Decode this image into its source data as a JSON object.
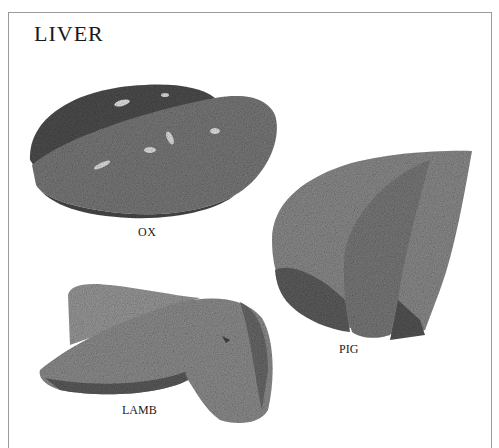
{
  "page": {
    "title": "LIVER",
    "figures": [
      {
        "id": "ox",
        "label": "OX"
      },
      {
        "id": "pig",
        "label": "PIG"
      },
      {
        "id": "lamb",
        "label": "LAMB"
      }
    ]
  },
  "colors": {
    "ox_dark": "#4e4e4e",
    "ox_light": "#777777",
    "pig_main": "#8a8a8a",
    "pig_dark": "#5a5a5a",
    "lamb_main": "#8e8e8e",
    "lamb_dark": "#5e5e5e",
    "border": "#9a9a9a"
  }
}
